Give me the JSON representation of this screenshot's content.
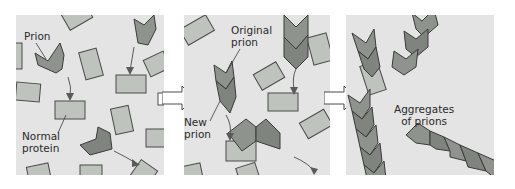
{
  "figure": {
    "panels": [
      {
        "id": "panel-1",
        "labels": {
          "prion": "Prion",
          "normal_protein_line1": "Normal",
          "normal_protein_line2": "protein"
        }
      },
      {
        "id": "panel-2",
        "labels": {
          "original_prion_line1": "Original",
          "original_prion_line2": "prion",
          "new_prion_line1": "New",
          "new_prion_line2": "prion"
        }
      },
      {
        "id": "panel-3",
        "labels": {
          "aggregates_line1": "Aggregates",
          "aggregates_line2": "of prions"
        }
      }
    ],
    "colors": {
      "background": "#e4e4e4",
      "normal_protein_fill": "#bfc3bd",
      "normal_protein_stroke": "#4a4a4a",
      "prion_fill": "#8e938d",
      "prion_fill_dark": "#6f746e",
      "arrow": "#5a5a5a",
      "step_arrow_fill": "#ffffff"
    }
  }
}
